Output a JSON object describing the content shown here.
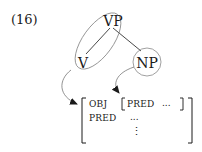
{
  "example_number": "(16)",
  "tree": {
    "root": {
      "label": "VP",
      "x": 113,
      "y": 21
    },
    "children": [
      {
        "label": "V",
        "x": 83,
        "y": 62
      },
      {
        "label": "NP",
        "x": 147,
        "y": 62
      }
    ],
    "groupings": [
      {
        "type": "ellipse",
        "encloses": [
          "VP",
          "V"
        ]
      },
      {
        "type": "circle",
        "encloses": [
          "NP"
        ]
      }
    ]
  },
  "fstructure": {
    "rows": [
      {
        "attr": "OBJ",
        "value": {
          "attr": "PRED",
          "value": "..."
        }
      },
      {
        "attr": "PRED",
        "value": "..."
      }
    ],
    "continuation": "⋮"
  },
  "mappings": [
    {
      "from": "V",
      "to": "outer f-structure"
    },
    {
      "from": "NP",
      "to": "OBJ value f-structure"
    }
  ],
  "colors": {
    "ink": "#1a1a1a",
    "outline": "#7a7a7a",
    "background": "#ffffff"
  }
}
